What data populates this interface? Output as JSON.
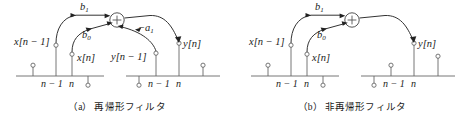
{
  "figure": {
    "panels": [
      {
        "id": "a",
        "caption_tag": "（a）",
        "caption_text": "再帰形フィルタ",
        "node": {
          "name": "summing-junction",
          "symbol": "+"
        },
        "gain_labels": [
          {
            "name": "gain-b1",
            "text": "b",
            "sub": "1"
          },
          {
            "name": "gain-b0",
            "text": "b",
            "sub": "0"
          },
          {
            "name": "gain-minus-a1",
            "text": "−a",
            "sub": "1"
          }
        ],
        "signal_labels": [
          {
            "name": "signal-x-n-minus-1",
            "text": "x[n − 1]"
          },
          {
            "name": "signal-x-n",
            "text": "x[n]"
          },
          {
            "name": "signal-y-n-minus-1",
            "text": "y[n − 1]"
          },
          {
            "name": "signal-y-n",
            "text": "y[n]"
          }
        ],
        "axis_left": {
          "name": "input-stem-axis",
          "ticks": [
            "n − 1",
            "n"
          ]
        },
        "axis_right": {
          "name": "output-stem-axis",
          "ticks": [
            "n − 1",
            "n"
          ]
        }
      },
      {
        "id": "b",
        "caption_tag": "（b）",
        "caption_text": "非再帰形フィルタ",
        "node": {
          "name": "summing-junction",
          "symbol": "+"
        },
        "gain_labels": [
          {
            "name": "gain-b1",
            "text": "b",
            "sub": "1"
          },
          {
            "name": "gain-b0",
            "text": "b",
            "sub": "0"
          }
        ],
        "signal_labels": [
          {
            "name": "signal-x-n-minus-1",
            "text": "x[n − 1]"
          },
          {
            "name": "signal-x-n",
            "text": "x[n]"
          },
          {
            "name": "signal-y-n",
            "text": "y[n]"
          }
        ],
        "axis_left": {
          "name": "input-stem-axis",
          "ticks": [
            "n − 1",
            "n"
          ]
        },
        "axis_right": {
          "name": "output-stem-axis",
          "ticks": [
            "n − 1",
            "n"
          ]
        }
      }
    ],
    "colors": {
      "stroke": "#555555",
      "ink": "#1a1a1a",
      "background": "#ffffff"
    }
  }
}
